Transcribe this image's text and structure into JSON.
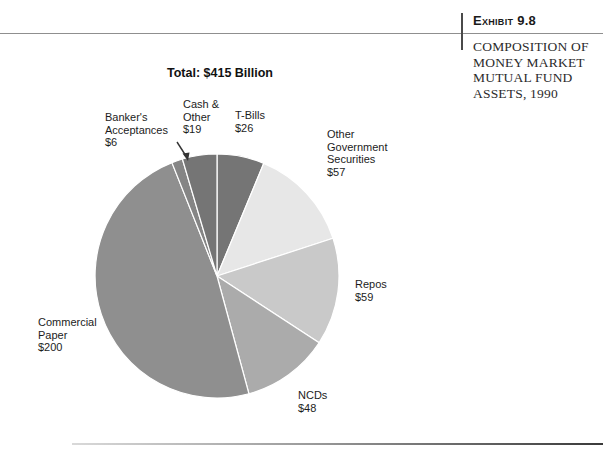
{
  "exhibit": {
    "tag": "Exhibit 9.8",
    "caption": "COMPOSITION OF\nMONEY MARKET\nMUTUAL FUND\nASSETS, 1990"
  },
  "chart_data": {
    "type": "pie",
    "title": "Total: $415 Billion",
    "total": 415,
    "start_angle_deg": 0,
    "direction": "clockwise",
    "legend_position": "labels-around-pie",
    "slices": [
      {
        "name": "T-Bills",
        "value": 26,
        "label": "T-Bills\n$26",
        "color": "#757575"
      },
      {
        "name": "Other Government Securities",
        "value": 57,
        "label": "Other\nGovernment\nSecurities\n$57",
        "color": "#e7e7e7"
      },
      {
        "name": "Repos",
        "value": 59,
        "label": "Repos\n$59",
        "color": "#c9c9c9"
      },
      {
        "name": "NCDs",
        "value": 48,
        "label": "NCDs\n$48",
        "color": "#ababab"
      },
      {
        "name": "Commercial Paper",
        "value": 200,
        "label": "Commercial\nPaper\n$200",
        "color": "#8f8f8f"
      },
      {
        "name": "Banker's Acceptances",
        "value": 6,
        "label": "Banker's\nAcceptances\n$6",
        "color": "#858585"
      },
      {
        "name": "Cash & Other",
        "value": 19,
        "label": "Cash &\nOther\n$19",
        "color": "#757575"
      }
    ]
  }
}
